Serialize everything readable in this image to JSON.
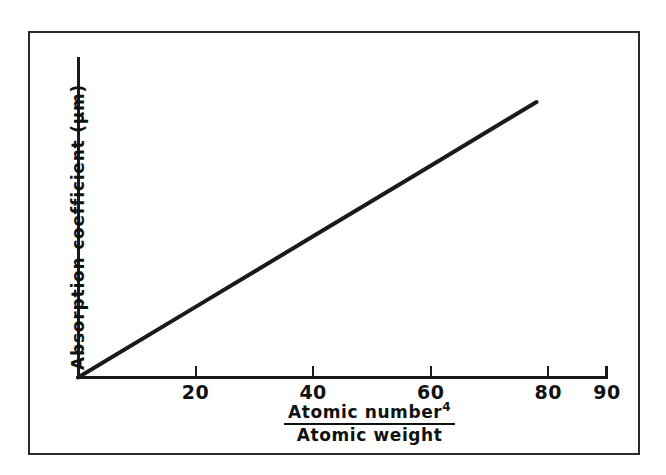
{
  "figure": {
    "background_color": "#ffffff",
    "frame_color": "#2b2b2b",
    "axis_color": "#1a1a1a",
    "line_color": "#1a1a1a"
  },
  "axes": {
    "y_title": "Absorption coefficient  (μm)",
    "x_title_numerator": "Atomic number",
    "x_title_numerator_exponent": "4",
    "x_title_denominator": "Atomic weight"
  },
  "chart_data": {
    "type": "line",
    "title": "",
    "subtitle": "",
    "xlabel": "Atomic number^4 / Atomic weight",
    "ylabel": "Absorption coefficient (μm)",
    "xlim": [
      0,
      90
    ],
    "ylim": [
      0,
      100
    ],
    "grid": false,
    "legend": false,
    "legend_position": "none",
    "x_ticks": [
      20,
      40,
      60,
      80,
      90
    ],
    "x_tick_labels": [
      "20",
      "40",
      "60",
      "80",
      "90"
    ],
    "y_ticks": [],
    "y_tick_labels": [],
    "annotations": [],
    "series": [
      {
        "name": "Absorption coefficient",
        "x": [
          0,
          20,
          40,
          60,
          78
        ],
        "y": [
          0,
          22.5,
          45,
          67.5,
          87.8
        ],
        "color": "#1a1a1a",
        "linewidth": 4,
        "style": "solid",
        "markers": "none"
      }
    ]
  }
}
